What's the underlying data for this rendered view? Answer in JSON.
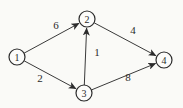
{
  "figure": {
    "type": "directed-graph",
    "canvas": {
      "width": 183,
      "height": 108,
      "background": "#fafaf7"
    },
    "style": {
      "node_fill": "#fcfcfa",
      "stroke_color": "#2b2b2b",
      "edge_color": "#3a3a3a"
    },
    "nodes": [
      {
        "id": "1",
        "label": "1",
        "x": 17,
        "y": 57,
        "r": 8
      },
      {
        "id": "2",
        "label": "2",
        "x": 87,
        "y": 19,
        "r": 8
      },
      {
        "id": "3",
        "label": "3",
        "x": 84,
        "y": 93,
        "r": 8
      },
      {
        "id": "4",
        "label": "4",
        "x": 164,
        "y": 60,
        "r": 8
      }
    ],
    "edges": [
      {
        "from": "1",
        "to": "2",
        "weight": "6",
        "label_x": 56,
        "label_y": 29
      },
      {
        "from": "1",
        "to": "3",
        "weight": "2",
        "label_x": 40,
        "label_y": 82
      },
      {
        "from": "3",
        "to": "2",
        "weight": "1",
        "label_x": 97,
        "label_y": 56
      },
      {
        "from": "2",
        "to": "4",
        "weight": "4",
        "label_x": 133,
        "label_y": 34
      },
      {
        "from": "3",
        "to": "4",
        "weight": "8",
        "label_x": 128,
        "label_y": 81
      }
    ]
  }
}
